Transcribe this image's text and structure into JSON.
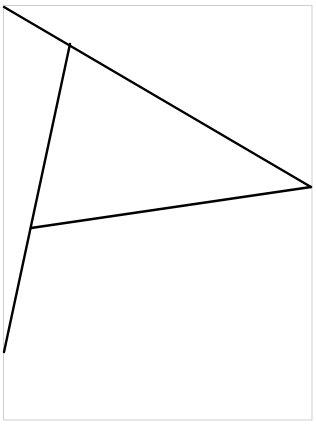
{
  "canvas": {
    "width": 316,
    "height": 424,
    "background": "#ffffff"
  },
  "frame": {
    "x": 3.5,
    "y": 5.5,
    "width": 308.5,
    "height": 414.5,
    "stroke": "#cfcfcf",
    "stroke_width": 1
  },
  "line_style": {
    "stroke": "#000000",
    "stroke_width": 2.4
  },
  "segments": [
    {
      "name": "top-diagonal",
      "x1": 4,
      "y1": 7,
      "x2": 311,
      "y2": 187
    },
    {
      "name": "left-steep",
      "x1": 70,
      "y1": 44,
      "x2": 4,
      "y2": 352
    },
    {
      "name": "middle-crossbar",
      "x1": 31,
      "y1": 228,
      "x2": 311,
      "y2": 187
    }
  ]
}
